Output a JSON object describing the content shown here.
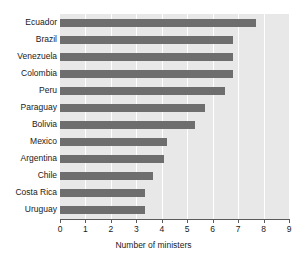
{
  "chart_data": {
    "type": "bar",
    "orientation": "horizontal",
    "title": "",
    "xlabel": "Number of ministers",
    "ylabel": "",
    "xlim": [
      0,
      9
    ],
    "xticks": [
      0,
      1,
      2,
      3,
      4,
      5,
      6,
      7,
      8,
      9
    ],
    "xticklabels": [
      "0",
      "1",
      "2",
      "3",
      "4",
      "5",
      "6",
      "7",
      "8",
      "9"
    ],
    "grid": "vertical-white-gridlines",
    "legend": "none",
    "categories": [
      "Ecuador",
      "Brazil",
      "Venezuela",
      "Colombia",
      "Peru",
      "Paraguay",
      "Bolivia",
      "Mexico",
      "Argentina",
      "Chile",
      "Costa Rica",
      "Uruguay"
    ],
    "values": [
      7.7,
      6.8,
      6.8,
      6.8,
      6.5,
      5.7,
      5.3,
      4.2,
      4.1,
      3.65,
      3.35,
      3.35
    ],
    "colors": {
      "bar": "#6e6e6e",
      "plot_background": "#e8e8e8",
      "gridline": "#ffffff",
      "axis": "#5a5a5a",
      "text": "#1a1a1a",
      "figure_background": "#ffffff"
    }
  }
}
